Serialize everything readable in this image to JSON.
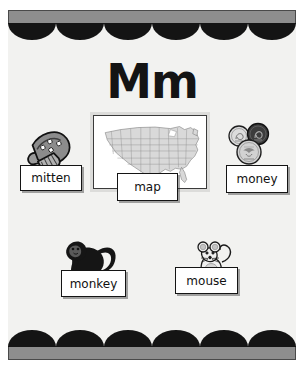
{
  "poster": {
    "title": "Mm",
    "letter_upper": "M",
    "letter_lower": "m",
    "background_color": "#f2f2f0",
    "border_color": "#141414",
    "border_bar_color": "#8e8e8e",
    "scallop_count": 6
  },
  "items": [
    {
      "id": "mitten",
      "label": "mitten",
      "icon": "mitten-icon",
      "art_style": "grayscale clip-art mitten with snowflake dots and ribbed cuff"
    },
    {
      "id": "map",
      "label": "map",
      "icon": "us-map-icon",
      "art_style": "outline map of the United States with state borders in a white framed box"
    },
    {
      "id": "money",
      "label": "money",
      "icon": "coins-icon",
      "art_style": "three overlapping coins, one dark penny and two light silver coins"
    },
    {
      "id": "monkey",
      "label": "monkey",
      "icon": "monkey-icon",
      "art_style": "black silhouette monkey on all fours with curled tail"
    },
    {
      "id": "mouse",
      "label": "mouse",
      "icon": "mouse-icon",
      "art_style": "line-art mouse sitting upright with large round ears and curled tail"
    }
  ]
}
